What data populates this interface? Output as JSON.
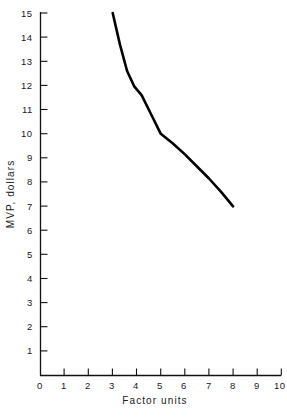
{
  "chart_data": {
    "type": "line",
    "title": "",
    "xlabel": "Factor units",
    "ylabel": "MVP, dollars",
    "xlim": [
      0,
      10
    ],
    "ylim": [
      0,
      15
    ],
    "xticks": [
      "0",
      "1",
      "2",
      "3",
      "4",
      "5",
      "6",
      "7",
      "8",
      "9",
      "10"
    ],
    "yticks": [
      "0",
      "1",
      "2",
      "3",
      "4",
      "5",
      "6",
      "7",
      "8",
      "9",
      "10",
      "11",
      "12",
      "13",
      "14",
      "15"
    ],
    "grid": false,
    "legend": null,
    "series": [
      {
        "name": "MVP",
        "color": "#000000",
        "x": [
          3.0,
          3.3,
          3.6,
          3.9,
          4.2,
          4.6,
          5.0,
          5.5,
          6.0,
          6.5,
          7.0,
          7.5,
          8.0
        ],
        "values": [
          15.0,
          13.7,
          12.6,
          11.95,
          11.6,
          10.8,
          10.0,
          9.6,
          9.15,
          8.65,
          8.15,
          7.6,
          7.0
        ]
      }
    ],
    "annotations": []
  },
  "axes": {
    "x_axis_name": "x-axis",
    "y_axis_name": "y-axis"
  }
}
